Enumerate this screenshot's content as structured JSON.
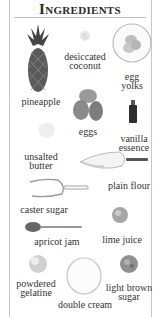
{
  "page": {
    "title": "Ingredients",
    "ingredients": [
      {
        "name": "pineapple",
        "line1": "pineapple"
      },
      {
        "name": "desiccated coconut",
        "line1": "desiccated",
        "line2": "coconut"
      },
      {
        "name": "egg yolks",
        "line1": "egg",
        "line2": "yolks"
      },
      {
        "name": "eggs",
        "line1": "eggs"
      },
      {
        "name": "vanilla essence",
        "line1": "vanilla",
        "line2": "essence"
      },
      {
        "name": "unsalted butter",
        "line1": "unsalted",
        "line2": "butter"
      },
      {
        "name": "plain flour",
        "line1": "plain flour"
      },
      {
        "name": "caster sugar",
        "line1": "caster sugar"
      },
      {
        "name": "lime juice",
        "line1": "lime juice"
      },
      {
        "name": "apricot jam",
        "line1": "apricot jam"
      },
      {
        "name": "powdered gelatine",
        "line1": "powdered",
        "line2": "gelatine"
      },
      {
        "name": "double cream",
        "line1": "double cream"
      },
      {
        "name": "light brown sugar",
        "line1": "light brown",
        "line2": "sugar"
      }
    ]
  }
}
